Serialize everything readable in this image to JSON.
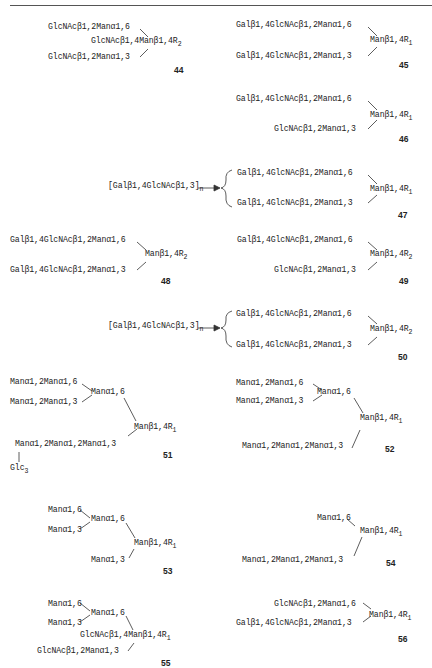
{
  "structures": {
    "s44": {
      "number": "44",
      "line1": "GlcNAcβ1,2Manα1,6",
      "line2": "GlcNAcβ1,4Manβ1,4R",
      "line2_sub": "2",
      "line3": "GlcNAcβ1,2Manα1,3"
    },
    "s45": {
      "number": "45",
      "line1": "Galβ1,4GlcNAcβ1,2Manα1,6",
      "core": "Manβ1,4R",
      "core_sub": "1",
      "line3": "Galβ1,4GlcNAcβ1,2Manα1,3"
    },
    "s46": {
      "number": "46",
      "line1": "Galβ1,4GlcNAcβ1,2Manα1,6",
      "core": "Manβ1,4R",
      "core_sub": "1",
      "line3": "GlcNAcβ1,2Manα1,3"
    },
    "s47": {
      "number": "47",
      "repeat": "[Galβ1,4GlcNAcβ1,3]",
      "repeat_sub": "n",
      "line1": "Galβ1,4GlcNAcβ1,2Manα1,6",
      "core": "Manβ1,4R",
      "core_sub": "1",
      "line3": "Galβ1,4GlcNAcβ1,2Manα1,3"
    },
    "s48": {
      "number": "48",
      "line1": "Galβ1,4GlcNAcβ1,2Manα1,6",
      "core": "Manβ1,4R",
      "core_sub": "2",
      "line3": "Galβ1,4GlcNAcβ1,2Manα1,3"
    },
    "s49": {
      "number": "49",
      "line1": "Galβ1,4GlcNAcβ1,2Manα1,6",
      "core": "Manβ1,4R",
      "core_sub": "2",
      "line3": "GlcNAcβ1,2Manα1,3"
    },
    "s50": {
      "number": "50",
      "repeat": "[Galβ1,4GlcNAcβ1,3]",
      "repeat_sub": "n",
      "line1": "Galβ1,4GlcNAcβ1,2Manα1,6",
      "core": "Manβ1,4R",
      "core_sub": "2",
      "line3": "Galβ1,4GlcNAcβ1,2Manα1,3"
    },
    "s51": {
      "number": "51",
      "a1": "Manα1,2Manα1,6",
      "a2": "Manα1,2Manα1,3",
      "branch": "Manα1,6",
      "core": "Manβ1,4R",
      "core_sub": "1",
      "a3": "Manα1,2Manα1,2Manα1,3",
      "glc": "Glc",
      "glc_sub": "3"
    },
    "s52": {
      "number": "52",
      "a1": "Manα1,2Manα1,6",
      "a2": "Manα1,2Manα1,3",
      "branch": "Manα1,6",
      "core": "Manβ1,4R",
      "core_sub": "1",
      "a3": "Manα1,2Manα1,2Manα1,3"
    },
    "s53": {
      "number": "53",
      "a1": "Manα1,6",
      "a2": "Manα1,3",
      "branch": "Manα1,6",
      "core": "Manβ1,4R",
      "core_sub": "1",
      "a3": "Manα1,3"
    },
    "s54": {
      "number": "54",
      "a1": "Manα1,6",
      "core": "Manβ1,4R",
      "core_sub": "1",
      "a3": "Manα1,2Manα1,2Manα1,3"
    },
    "s55": {
      "number": "55",
      "a1": "Manα1,6",
      "a2": "Manα1,3",
      "branch": "Manα1,6",
      "core": "GlcNAcβ1,4Manβ1,4R",
      "core_sub": "1",
      "a3": "GlcNAcβ1,2Manα1,3"
    },
    "s56": {
      "number": "56",
      "line1": "GlcNAcβ1,2Manα1,6",
      "core": "Manβ1,4R",
      "core_sub": "1",
      "line3": "Galβ1,4GlcNAcβ1,2Manα1,3"
    }
  }
}
